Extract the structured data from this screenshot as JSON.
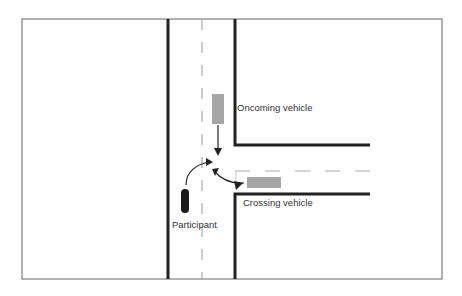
{
  "diagram": {
    "type": "intersection-scenario",
    "labels": {
      "oncoming": "Oncoming vehicle",
      "crossing": "Crossing vehicle",
      "participant": "Participant"
    },
    "colors": {
      "frame": "#666666",
      "road_edge": "#222222",
      "lane_marking": "#aaaaaa",
      "vehicle": "#a6a6a6",
      "participant": "#1a1a1a",
      "arrow": "#222222"
    }
  }
}
